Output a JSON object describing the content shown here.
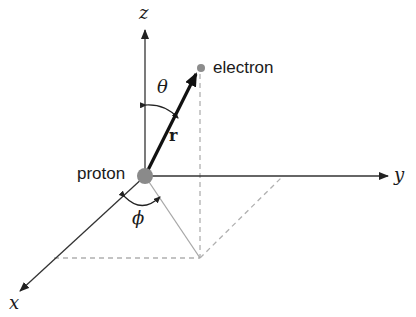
{
  "diagram": {
    "title": "",
    "labels": {
      "z_axis": "z",
      "y_axis": "y",
      "x_axis": "x",
      "theta": "θ",
      "phi": "ϕ",
      "r_vector": "r",
      "electron": "electron",
      "proton": "proton"
    },
    "colors": {
      "axis": "#333333",
      "projection": "#aaaaaa",
      "dashed": "#b0b0b0",
      "proton": "#8a8a8a",
      "electron": "#8c8c8c",
      "r_vector": "#111111"
    }
  }
}
